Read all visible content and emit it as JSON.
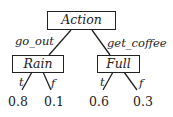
{
  "diagram": {
    "type": "decision-tree",
    "root": {
      "label": "Action",
      "children": [
        {
          "edge_label": "go_out",
          "label": "Rain",
          "branches": [
            {
              "edge_label": "t",
              "value": "0.8"
            },
            {
              "edge_label": "f",
              "value": "0.1"
            }
          ]
        },
        {
          "edge_label": "get_coffee",
          "label": "Full",
          "branches": [
            {
              "edge_label": "t",
              "value": "0.6"
            },
            {
              "edge_label": "f",
              "value": "0.3"
            }
          ]
        }
      ]
    },
    "colors": {
      "stroke": "#222222",
      "background": "#ffffff"
    }
  }
}
